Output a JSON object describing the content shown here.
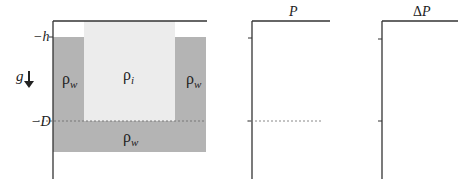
{
  "colors": {
    "water": "#b4b4b4",
    "ice": "#ececec",
    "axis": "#333333",
    "dashed": "#777777",
    "background": "#ffffff"
  },
  "left_panel": {
    "depth_labels": {
      "h": "−h",
      "D": "−D"
    },
    "gravity_label": "g",
    "gravity_icon": "down-arrow",
    "regions": {
      "water_left": {
        "label": "ρ",
        "subscript": "w"
      },
      "ice": {
        "label": "ρ",
        "subscript": "i"
      },
      "water_right": {
        "label": "ρ",
        "subscript": "w"
      },
      "water_bottom": {
        "label": "ρ",
        "subscript": "w"
      }
    }
  },
  "middle_panel": {
    "title": "P"
  },
  "right_panel": {
    "title": "ΔP"
  }
}
